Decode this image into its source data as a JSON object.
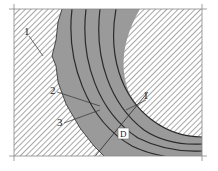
{
  "diagram": {
    "type": "cross-section of curved layered band through hatched material",
    "colors": {
      "band_fill": "#9a9a9a",
      "hatch_line": "#777777",
      "contour_line": "#2a2a2a",
      "frame_line": "#888888",
      "background": "#ffffff"
    },
    "labels": [
      {
        "id": "label-1-top-left",
        "text": "1",
        "x": 26,
        "y": 35
      },
      {
        "id": "label-2",
        "text": "2",
        "x": 52,
        "y": 94
      },
      {
        "id": "label-3",
        "text": "3",
        "x": 59,
        "y": 125
      },
      {
        "id": "label-1-right",
        "text": "1",
        "x": 144,
        "y": 99
      },
      {
        "id": "label-d",
        "text": "D",
        "x": 122,
        "y": 137
      }
    ]
  }
}
